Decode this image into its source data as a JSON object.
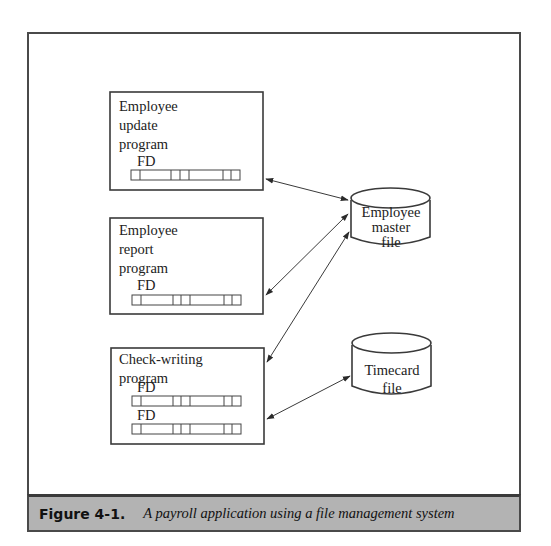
{
  "figure": {
    "number": "Figure 4-1.",
    "caption": "A payroll application using a file management system"
  },
  "programs": [
    {
      "lines": [
        "Employee",
        "update",
        "program"
      ],
      "fd_labels": [
        "FD"
      ]
    },
    {
      "lines": [
        "Employee",
        "report",
        "program"
      ],
      "fd_labels": [
        "FD"
      ]
    },
    {
      "lines": [
        "Check-writing",
        "program"
      ],
      "fd_labels": [
        "FD",
        "FD"
      ]
    }
  ],
  "files": [
    {
      "lines": [
        "Employee",
        "master",
        "file"
      ]
    },
    {
      "lines": [
        "Timecard",
        "file"
      ]
    }
  ],
  "connections": [
    {
      "from": "Employee update program",
      "to": "Employee master file",
      "type": "bidirectional"
    },
    {
      "from": "Employee report program",
      "to": "Employee master file",
      "type": "bidirectional"
    },
    {
      "from": "Check-writing program",
      "to": "Employee master file",
      "type": "bidirectional"
    },
    {
      "from": "Check-writing program",
      "to": "Timecard file",
      "type": "bidirectional"
    }
  ],
  "colors": {
    "line": "#3a3a3a",
    "caption_bg": "#b3b3b3"
  }
}
